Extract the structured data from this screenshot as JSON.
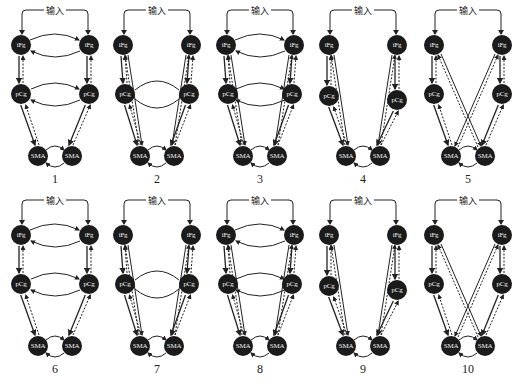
{
  "figure": {
    "input_label": "输入",
    "node_labels": {
      "ifg": "iFg",
      "pcg": "pCg",
      "sma": "SMA"
    },
    "caption_visible": "",
    "colors": {
      "node_fill": "#1b1b1b",
      "node_text": "#f2f2f2",
      "edge": "#222222",
      "background": "#ffffff"
    },
    "panels": [
      {
        "number": "1",
        "type": "full-lateral",
        "ifg_ifg": true,
        "pcg_pcg": "bidir",
        "sma_sma": true,
        "ifg_pcg": true,
        "pcg_sma": true,
        "ifg_sma_same": false,
        "ifg_sma_cross": false
      },
      {
        "number": "2",
        "type": "pcg-lateral-ifg-sma",
        "ifg_ifg": false,
        "pcg_pcg": "plain",
        "sma_sma": true,
        "ifg_pcg": true,
        "pcg_sma": true,
        "ifg_sma_same": true,
        "ifg_sma_cross": false
      },
      {
        "number": "3",
        "type": "full-lateral-ifg-sma",
        "ifg_ifg": true,
        "pcg_pcg": "bidir",
        "sma_sma": true,
        "ifg_pcg": true,
        "pcg_sma": true,
        "ifg_sma_same": true,
        "ifg_sma_cross": false
      },
      {
        "number": "4",
        "type": "no-lateral-ifg-sma",
        "ifg_ifg": false,
        "pcg_pcg": "none",
        "sma_sma": true,
        "ifg_pcg": true,
        "pcg_sma": true,
        "ifg_sma_same": true,
        "ifg_sma_cross": false
      },
      {
        "number": "5",
        "type": "crossed-ifg-sma",
        "ifg_ifg": false,
        "pcg_pcg": "none",
        "sma_sma": true,
        "ifg_pcg": true,
        "pcg_sma": true,
        "ifg_sma_same": false,
        "ifg_sma_cross": true
      },
      {
        "number": "6",
        "type": "full-lateral",
        "ifg_ifg": true,
        "pcg_pcg": "bidir",
        "sma_sma": true,
        "ifg_pcg": true,
        "pcg_sma": true,
        "ifg_sma_same": false,
        "ifg_sma_cross": false
      },
      {
        "number": "7",
        "type": "pcg-lateral-ifg-sma",
        "ifg_ifg": false,
        "pcg_pcg": "plain",
        "sma_sma": true,
        "ifg_pcg": true,
        "pcg_sma": true,
        "ifg_sma_same": true,
        "ifg_sma_cross": false
      },
      {
        "number": "8",
        "type": "full-lateral-ifg-sma",
        "ifg_ifg": true,
        "pcg_pcg": "bidir",
        "sma_sma": true,
        "ifg_pcg": true,
        "pcg_sma": true,
        "ifg_sma_same": true,
        "ifg_sma_cross": false
      },
      {
        "number": "9",
        "type": "no-lateral-ifg-sma",
        "ifg_ifg": false,
        "pcg_pcg": "none",
        "sma_sma": true,
        "ifg_pcg": true,
        "pcg_sma": true,
        "ifg_sma_same": true,
        "ifg_sma_cross": false
      },
      {
        "number": "10",
        "type": "crossed-ifg-sma",
        "ifg_ifg": false,
        "pcg_pcg": "none",
        "sma_sma": true,
        "ifg_pcg": true,
        "pcg_sma": true,
        "ifg_sma_same": false,
        "ifg_sma_cross": true
      }
    ]
  }
}
